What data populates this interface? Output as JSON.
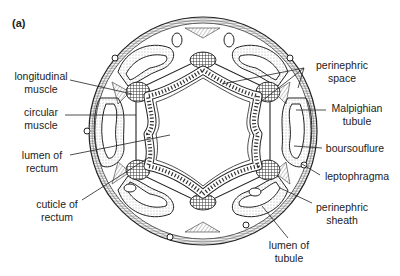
{
  "figure": {
    "panel_label": "(a)",
    "colors": {
      "ink": "#2a2a2a",
      "background": "#ffffff",
      "stipple": "#6a6a6a"
    }
  },
  "labels": {
    "longitudinal_muscle": {
      "line1": "longitudinal",
      "line2": "muscle"
    },
    "circular_muscle": {
      "line1": "circular",
      "line2": "muscle"
    },
    "lumen_of_rectum": {
      "line1": "lumen of",
      "line2": "rectum"
    },
    "cuticle_of_rectum": {
      "line1": "cuticle of",
      "line2": "rectum"
    },
    "perinephric_space": {
      "line1": "perinephric",
      "line2": "space"
    },
    "malpighian_tubule": {
      "line1": "Malpighian",
      "line2": "tubule"
    },
    "boursouflure": {
      "line1": "boursouflure"
    },
    "leptophragma": {
      "line1": "leptophragma"
    },
    "perinephric_sheath": {
      "line1": "perinephric",
      "line2": "sheath"
    },
    "lumen_of_tubule": {
      "line1": "lumen of",
      "line2": "tubule"
    }
  }
}
